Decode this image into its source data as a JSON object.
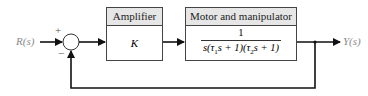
{
  "diagram": {
    "type": "closed-loop block diagram",
    "input": {
      "label": "R(s)"
    },
    "output": {
      "label": "Y(s)"
    },
    "summing_junction": {
      "plus_sign": "+",
      "minus_sign": "−"
    },
    "blocks": [
      {
        "title": "Amplifier",
        "transfer_function": "K"
      },
      {
        "title": "Motor and manipulator",
        "numerator": "1",
        "denominator_parts": [
          "s(τ",
          "1",
          "s + 1)(τ",
          "2",
          "s + 1)"
        ]
      }
    ],
    "feedback": "unity negative feedback",
    "colors": {
      "line": "#111111",
      "header_fill": "#e6e6e6",
      "io_label": "#8a8a8a"
    }
  }
}
